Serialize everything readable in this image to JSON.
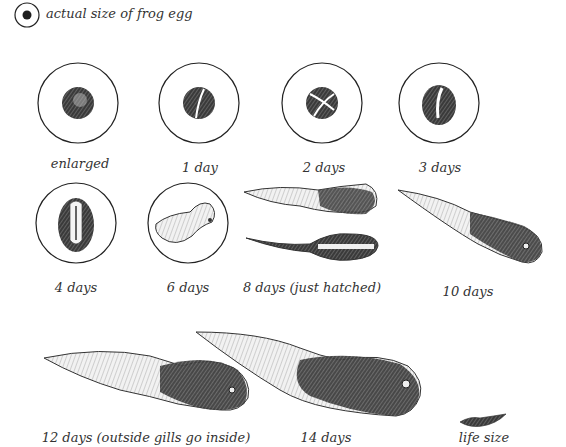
{
  "legend": {
    "text": "actual size of frog egg"
  },
  "stages": [
    {
      "label": "enlarged"
    },
    {
      "label": "1 day"
    },
    {
      "label": "2 days"
    },
    {
      "label": "3 days"
    },
    {
      "label": "4 days"
    },
    {
      "label": "6 days"
    },
    {
      "label": "8 days (just hatched)"
    },
    {
      "label": "10 days"
    },
    {
      "label": "12 days (outside gills go inside)"
    },
    {
      "label": "14 days"
    },
    {
      "label": "life size"
    }
  ],
  "colors": {
    "ink": "#2a2a2a",
    "background": "#ffffff"
  }
}
